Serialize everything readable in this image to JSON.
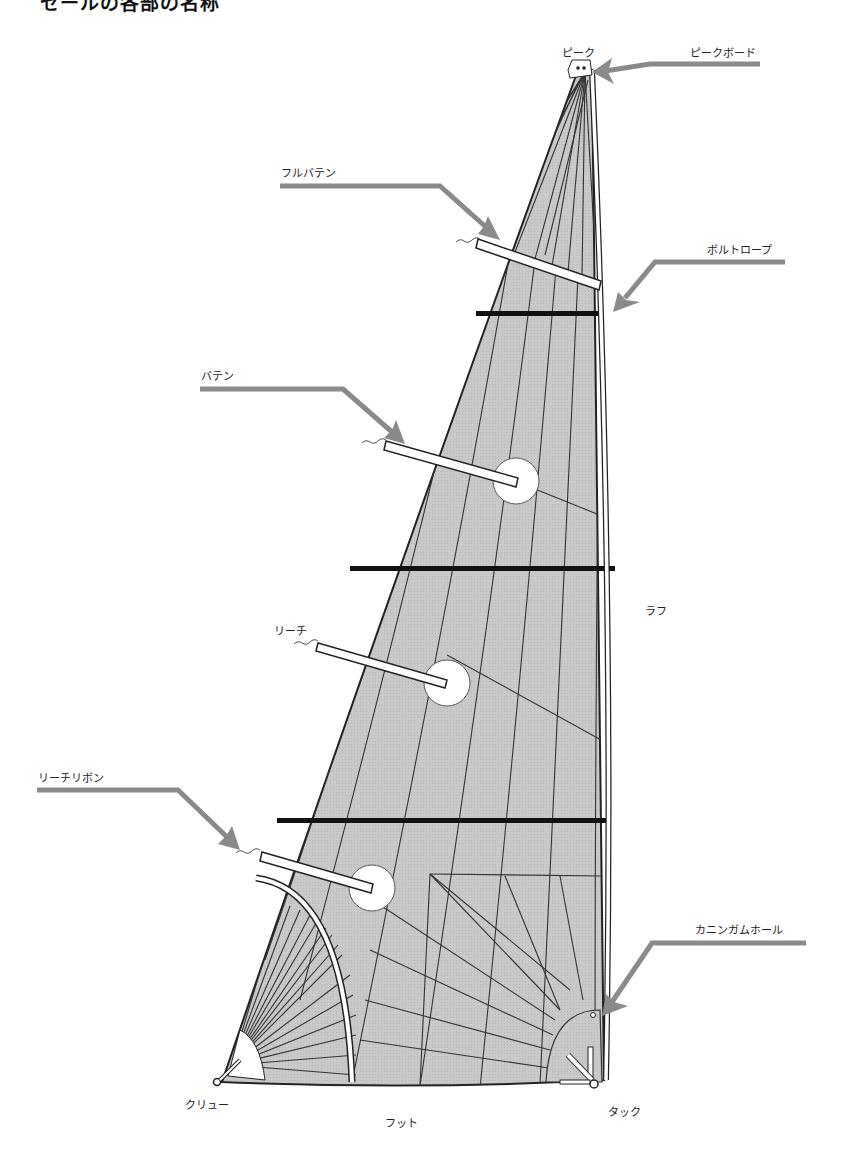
{
  "title": "セールの各部の名称",
  "colors": {
    "sail_fill": "#c8c8c8",
    "seam_line": "#333333",
    "leader_arrow": "#8a8a8a",
    "reef_band": "#111111",
    "batten_fill": "#ffffff"
  },
  "labels": {
    "peak": "ピーク",
    "peak_board": "ピークボード",
    "full_batten": "フルバテン",
    "bolt_rope": "ボルトロープ",
    "batten": "バテン",
    "luff": "ラフ",
    "leech": "リーチ",
    "leech_ribbon": "リーチリボン",
    "cunningham_hole": "カニンガムホール",
    "clew": "クリュー",
    "foot": "フット",
    "tack": "タック"
  }
}
